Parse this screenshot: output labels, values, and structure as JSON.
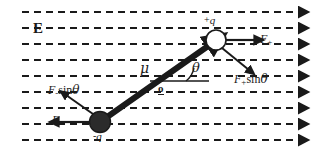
{
  "figure": {
    "background_color": "#ffffff",
    "ink_color": "#1a1a1a",
    "width": 319,
    "height": 155
  },
  "field": {
    "label": "E",
    "label_name": "electric-field-label",
    "direction": "left-to-right",
    "line_count": 9,
    "line_y": [
      12,
      28,
      44,
      60,
      76,
      92,
      108,
      124,
      140
    ],
    "dash_pattern": "7 5",
    "stroke_color": "#1a1a1a",
    "arrowhead": "solid-triangle-right"
  },
  "dipole": {
    "axis_from": [
      100,
      122
    ],
    "axis_to": [
      216,
      40
    ],
    "moment_label": "μ",
    "moment_underline": true,
    "origin_label": "o",
    "angle_label": "θ",
    "angle_degrees": 35,
    "positive_charge": {
      "label_sign": "+",
      "label_symbol": "q",
      "marker": "open-circle",
      "cx": 216,
      "cy": 40,
      "r": 10
    },
    "negative_charge": {
      "label_sign": "-",
      "label_symbol": "q",
      "marker": "filled-circle",
      "cx": 100,
      "cy": 122,
      "r": 10
    }
  },
  "forces": [
    {
      "id": "f-plus",
      "label_base": "F",
      "label_sub": "+",
      "label_fn": "",
      "label_greek": "",
      "description": "force on positive charge, along field",
      "direction": "right"
    },
    {
      "id": "f-plus-sin-theta",
      "label_base": "F",
      "label_sub": "+",
      "label_fn": "sin",
      "label_greek": "θ",
      "description": "perpendicular component at positive charge",
      "direction": "down-right"
    },
    {
      "id": "f-minus",
      "label_base": "F",
      "label_sub": "-",
      "label_fn": "",
      "label_greek": "",
      "description": "force on negative charge, against field",
      "direction": "left"
    },
    {
      "id": "f-minus-sin-theta",
      "label_base": "F",
      "label_sub": "-",
      "label_fn": "sin",
      "label_greek": "θ",
      "description": "perpendicular component at negative charge",
      "direction": "up-left"
    }
  ]
}
